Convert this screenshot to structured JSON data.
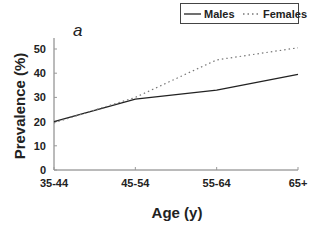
{
  "chart_data": {
    "type": "line",
    "panel_label": "a",
    "title": "",
    "xlabel": "Age (y)",
    "ylabel": "Prevalence (%)",
    "categories": [
      "35-44",
      "45-54",
      "55-64",
      "65+"
    ],
    "series": [
      {
        "name": "Males",
        "style": "solid",
        "color": "#222222",
        "values": [
          20,
          29.3,
          33,
          39.5
        ]
      },
      {
        "name": "Females",
        "style": "dotted",
        "color": "#777777",
        "values": [
          19.5,
          30,
          45.5,
          50.5
        ]
      }
    ],
    "ylim": [
      0,
      55
    ],
    "yticks": [
      0,
      10,
      20,
      30,
      40,
      50
    ],
    "grid": false,
    "legend_position": "top-right"
  }
}
